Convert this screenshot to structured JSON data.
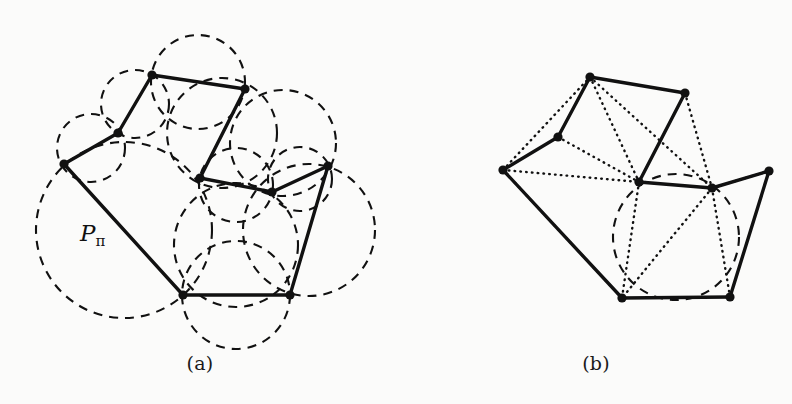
{
  "figure": {
    "width": 792,
    "height": 404,
    "background": "#fbfbfa",
    "ink": "#111111",
    "type": "geometry-diagram"
  },
  "panels": [
    {
      "id": "a",
      "caption": "(a)",
      "polygon_label": "P",
      "polygon_label_sub": "π",
      "vertices": [
        {
          "name": "v1",
          "x": 64,
          "y": 164
        },
        {
          "name": "v2",
          "x": 118,
          "y": 133
        },
        {
          "name": "v3",
          "x": 152,
          "y": 75
        },
        {
          "name": "v4",
          "x": 245,
          "y": 89
        },
        {
          "name": "v5",
          "x": 200,
          "y": 178
        },
        {
          "name": "v6",
          "x": 272,
          "y": 192
        },
        {
          "name": "v7",
          "x": 328,
          "y": 166
        },
        {
          "name": "v8",
          "x": 290,
          "y": 295
        },
        {
          "name": "v9",
          "x": 183,
          "y": 295
        }
      ],
      "edges": [
        [
          "v1",
          "v2"
        ],
        [
          "v2",
          "v3"
        ],
        [
          "v3",
          "v4"
        ],
        [
          "v4",
          "v5"
        ],
        [
          "v5",
          "v6"
        ],
        [
          "v6",
          "v7"
        ],
        [
          "v7",
          "v8"
        ],
        [
          "v8",
          "v9"
        ],
        [
          "v9",
          "v1"
        ]
      ],
      "circles": [
        {
          "cx": 124,
          "cy": 230,
          "r": 88
        },
        {
          "cx": 91,
          "cy": 148,
          "r": 34
        },
        {
          "cx": 135,
          "cy": 104,
          "r": 34
        },
        {
          "cx": 198,
          "cy": 82,
          "r": 47
        },
        {
          "cx": 222,
          "cy": 133,
          "r": 55
        },
        {
          "cx": 236,
          "cy": 185,
          "r": 37
        },
        {
          "cx": 300,
          "cy": 179,
          "r": 32
        },
        {
          "cx": 309,
          "cy": 230,
          "r": 66
        },
        {
          "cx": 236,
          "cy": 245,
          "r": 62
        },
        {
          "cx": 236,
          "cy": 295,
          "r": 54
        },
        {
          "cx": 283,
          "cy": 143,
          "r": 53
        }
      ]
    },
    {
      "id": "b",
      "caption": "(b)",
      "polygon_label": "P",
      "polygon_label_sub": "π",
      "vertices": [
        {
          "name": "u1",
          "x": 503,
          "y": 170
        },
        {
          "name": "u2",
          "x": 558,
          "y": 137
        },
        {
          "name": "u3",
          "x": 590,
          "y": 77
        },
        {
          "name": "u4",
          "x": 685,
          "y": 93
        },
        {
          "name": "u5",
          "x": 639,
          "y": 182
        },
        {
          "name": "a",
          "x": 712,
          "y": 188
        },
        {
          "name": "u7",
          "x": 769,
          "y": 171
        },
        {
          "name": "b",
          "x": 730,
          "y": 297
        },
        {
          "name": "c",
          "x": 622,
          "y": 298
        }
      ],
      "edges": [
        [
          "u1",
          "u2"
        ],
        [
          "u2",
          "u3"
        ],
        [
          "u3",
          "u4"
        ],
        [
          "u4",
          "u5"
        ],
        [
          "u5",
          "a"
        ],
        [
          "a",
          "u7"
        ],
        [
          "u7",
          "b"
        ],
        [
          "b",
          "c"
        ],
        [
          "c",
          "u1"
        ]
      ],
      "diagonals": [
        [
          "u1",
          "u3"
        ],
        [
          "u1",
          "u5"
        ],
        [
          "u2",
          "u5"
        ],
        [
          "u3",
          "u5"
        ],
        [
          "u3",
          "a"
        ],
        [
          "u4",
          "a"
        ],
        [
          "a",
          "u7"
        ],
        [
          "u1",
          "c"
        ],
        [
          "u5",
          "c"
        ],
        [
          "a",
          "c"
        ],
        [
          "a",
          "b"
        ],
        [
          "u7",
          "a"
        ]
      ],
      "vertex_labels": [
        {
          "text": "a",
          "x": 710,
          "y": 163
        },
        {
          "text": "b",
          "x": 737,
          "y": 300
        },
        {
          "text": "c",
          "x": 606,
          "y": 300
        }
      ],
      "circles": [
        {
          "cx": 676,
          "cy": 237,
          "r": 63
        }
      ]
    }
  ]
}
